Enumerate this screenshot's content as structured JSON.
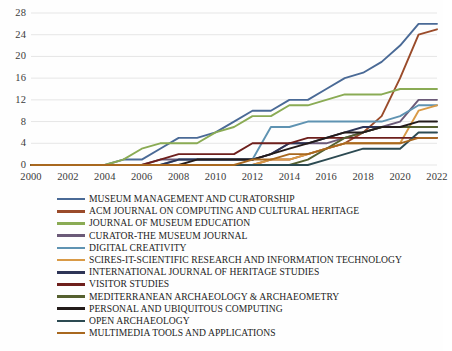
{
  "chart_data": {
    "type": "line",
    "title": "",
    "subtitle": "",
    "xlabel": "",
    "ylabel": "",
    "xlim": [
      2000,
      2022
    ],
    "ylim": [
      0,
      28
    ],
    "grid": true,
    "legend_position": "bottom",
    "x_ticks": [
      "2000",
      "2002",
      "2004",
      "2006",
      "2008",
      "2010",
      "2012",
      "2014",
      "2016",
      "2018",
      "2020",
      "2022"
    ],
    "y_ticks": [
      "0",
      "4",
      "8",
      "12",
      "16",
      "20",
      "24",
      "28"
    ],
    "x": [
      2000,
      2001,
      2002,
      2003,
      2004,
      2005,
      2006,
      2007,
      2008,
      2009,
      2010,
      2011,
      2012,
      2013,
      2014,
      2015,
      2016,
      2017,
      2018,
      2019,
      2020,
      2021,
      2022
    ],
    "series": [
      {
        "name": "MUSEUM MANAGEMENT AND CURATORSHIP",
        "color": "#4a6a96",
        "values": [
          0,
          0,
          0,
          0,
          0,
          1,
          1,
          3,
          5,
          5,
          6,
          8,
          10,
          10,
          12,
          12,
          14,
          16,
          17,
          19,
          22,
          26,
          26
        ]
      },
      {
        "name": "ACM JOURNAL ON COMPUTING AND CULTURAL HERITAGE",
        "color": "#9a4b2a",
        "values": [
          0,
          0,
          0,
          0,
          0,
          0,
          0,
          0,
          0,
          0,
          0,
          0,
          0,
          1,
          1,
          2,
          3,
          4,
          6,
          9,
          16,
          24,
          25
        ]
      },
      {
        "name": "JOURNAL OF MUSEUM EDUCATION",
        "color": "#8aab54",
        "values": [
          0,
          0,
          0,
          0,
          0,
          1,
          3,
          4,
          4,
          4,
          6,
          7,
          9,
          9,
          11,
          11,
          12,
          13,
          13,
          13,
          14,
          14,
          14
        ]
      },
      {
        "name": "CURATOR-THE MUSEUM JOURNAL",
        "color": "#6b5a78",
        "values": [
          0,
          0,
          0,
          0,
          0,
          0,
          0,
          1,
          1,
          1,
          1,
          1,
          1,
          2,
          4,
          4,
          4,
          5,
          6,
          7,
          8,
          12,
          12
        ]
      },
      {
        "name": "DIGITAL CREATIVITY",
        "color": "#5f93b2",
        "values": [
          0,
          0,
          0,
          0,
          0,
          0,
          0,
          0,
          1,
          1,
          1,
          1,
          1,
          7,
          7,
          8,
          8,
          8,
          8,
          8,
          9,
          11,
          11
        ]
      },
      {
        "name": "SCIRES-IT-SCIENTIFIC RESEARCH AND INFORMATION TECHNOLOGY",
        "color": "#d99a46",
        "values": [
          0,
          0,
          0,
          0,
          0,
          0,
          0,
          0,
          0,
          0,
          0,
          0,
          0,
          1,
          1,
          2,
          3,
          4,
          4,
          4,
          4,
          10,
          11
        ]
      },
      {
        "name": "INTERNATIONAL JOURNAL OF HERITAGE STUDIES",
        "color": "#2d3456",
        "values": [
          0,
          0,
          0,
          0,
          0,
          0,
          0,
          0,
          1,
          1,
          1,
          1,
          1,
          2,
          4,
          4,
          5,
          6,
          7,
          7,
          7,
          7,
          7
        ]
      },
      {
        "name": "VISITOR STUDIES",
        "color": "#6e1f1c",
        "values": [
          0,
          0,
          0,
          0,
          0,
          0,
          0,
          1,
          2,
          2,
          2,
          2,
          4,
          4,
          4,
          5,
          5,
          5,
          5,
          5,
          5,
          5,
          5
        ]
      },
      {
        "name": "MEDITERRANEAN ARCHAEOLOGY & ARCHAEOMETRY",
        "color": "#55602f",
        "values": [
          0,
          0,
          0,
          0,
          0,
          0,
          0,
          0,
          0,
          0,
          0,
          0,
          0,
          0,
          0,
          1,
          3,
          5,
          6,
          7,
          7,
          7,
          7
        ]
      },
      {
        "name": "PERSONAL AND UBIQUITOUS COMPUTING",
        "color": "#231b1a",
        "values": [
          0,
          0,
          0,
          0,
          0,
          0,
          0,
          0,
          0,
          1,
          1,
          1,
          1,
          2,
          3,
          4,
          5,
          6,
          6,
          7,
          7,
          8,
          8
        ]
      },
      {
        "name": "OPEN ARCHAEOLOGY",
        "color": "#2c4a52",
        "values": [
          0,
          0,
          0,
          0,
          0,
          0,
          0,
          0,
          0,
          0,
          0,
          0,
          0,
          0,
          0,
          0,
          1,
          2,
          3,
          3,
          3,
          6,
          6
        ]
      },
      {
        "name": "MULTIMEDIA TOOLS AND APPLICATIONS",
        "color": "#a8681f",
        "values": [
          0,
          0,
          0,
          0,
          0,
          0,
          0,
          0,
          0,
          0,
          0,
          0,
          1,
          1,
          2,
          2,
          3,
          4,
          4,
          4,
          4,
          5,
          5
        ]
      }
    ]
  },
  "legend": {
    "items": [
      {
        "label": "MUSEUM MANAGEMENT AND CURATORSHIP",
        "color": "#4a6a96"
      },
      {
        "label": "ACM JOURNAL ON COMPUTING AND CULTURAL HERITAGE",
        "color": "#9a4b2a"
      },
      {
        "label": "JOURNAL OF MUSEUM EDUCATION",
        "color": "#8aab54"
      },
      {
        "label": "CURATOR-THE MUSEUM JOURNAL",
        "color": "#6b5a78"
      },
      {
        "label": "DIGITAL CREATIVITY",
        "color": "#5f93b2"
      },
      {
        "label": "SCIRES-IT-SCIENTIFIC RESEARCH AND INFORMATION TECHNOLOGY",
        "color": "#d99a46"
      },
      {
        "label": "INTERNATIONAL JOURNAL OF HERITAGE STUDIES",
        "color": "#2d3456"
      },
      {
        "label": "VISITOR STUDIES",
        "color": "#6e1f1c"
      },
      {
        "label": "MEDITERRANEAN ARCHAEOLOGY & ARCHAEOMETRY",
        "color": "#55602f"
      },
      {
        "label": "PERSONAL AND UBIQUITOUS COMPUTING",
        "color": "#231b1a"
      },
      {
        "label": "OPEN ARCHAEOLOGY",
        "color": "#2c4a52"
      },
      {
        "label": "MULTIMEDIA TOOLS AND APPLICATIONS",
        "color": "#a8681f"
      }
    ]
  },
  "style": {
    "gridline_color": "#e6e6e6",
    "axis_text_color": "#3b3b3b",
    "background": "#ffffff"
  }
}
